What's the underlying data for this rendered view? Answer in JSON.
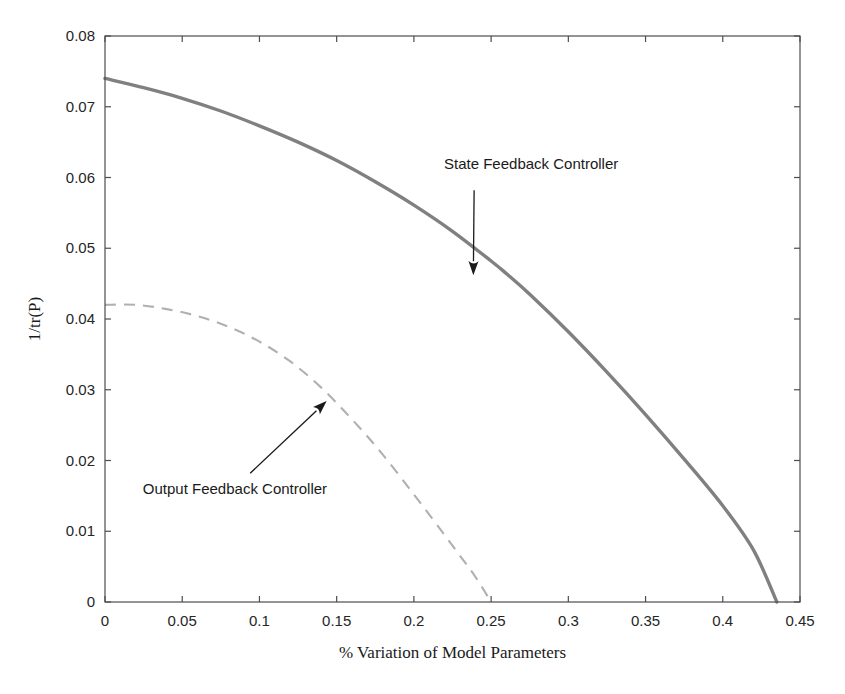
{
  "chart_data": {
    "type": "line",
    "title": "",
    "xlabel": "% Variation of Model Parameters",
    "ylabel": "1/tr(P)",
    "xlim": [
      0,
      0.45
    ],
    "ylim": [
      0,
      0.08
    ],
    "grid": false,
    "legend_position": "none",
    "xticks": [
      "0",
      "0.05",
      "0.1",
      "0.15",
      "0.2",
      "0.25",
      "0.3",
      "0.35",
      "0.4",
      "0.45"
    ],
    "xtick_values": [
      0,
      0.05,
      0.1,
      0.15,
      0.2,
      0.25,
      0.3,
      0.35,
      0.4,
      0.45
    ],
    "yticks": [
      "0",
      "0.01",
      "0.02",
      "0.03",
      "0.04",
      "0.05",
      "0.06",
      "0.07",
      "0.08"
    ],
    "ytick_values": [
      0,
      0.01,
      0.02,
      0.03,
      0.04,
      0.05,
      0.06,
      0.07,
      0.08
    ],
    "series": [
      {
        "name": "State Feedback Controller",
        "style": "solid",
        "color": "#808080",
        "x": [
          0.0,
          0.025,
          0.05,
          0.075,
          0.1,
          0.125,
          0.15,
          0.175,
          0.2,
          0.225,
          0.25,
          0.26,
          0.275,
          0.3,
          0.325,
          0.35,
          0.375,
          0.4,
          0.42,
          0.435
        ],
        "y": [
          0.074,
          0.0727,
          0.0712,
          0.0694,
          0.0673,
          0.065,
          0.0624,
          0.0594,
          0.0561,
          0.0524,
          0.0482,
          0.0464,
          0.0435,
          0.0382,
          0.0325,
          0.0265,
          0.0202,
          0.0136,
          0.0073,
          0.0
        ]
      },
      {
        "name": "Output Feedback Controller",
        "style": "dashed",
        "color": "#b0b0b0",
        "x": [
          0.0,
          0.02,
          0.04,
          0.06,
          0.08,
          0.1,
          0.12,
          0.14,
          0.16,
          0.18,
          0.2,
          0.215,
          0.23,
          0.24,
          0.25
        ],
        "y": [
          0.042,
          0.042,
          0.0414,
          0.0404,
          0.0389,
          0.0368,
          0.034,
          0.0303,
          0.0258,
          0.0208,
          0.0152,
          0.0109,
          0.0065,
          0.0035,
          0.0
        ]
      }
    ],
    "annotations": [
      {
        "text": "State Feedback Controller",
        "text_x": 0.2195,
        "text_y": 0.0612,
        "arrow_from_x": 0.239,
        "arrow_from_y": 0.0582,
        "arrow_to_x": 0.2385,
        "arrow_to_y": 0.0462
      },
      {
        "text": "Output Feedback Controller",
        "text_x": 0.0245,
        "text_y": 0.0153,
        "arrow_from_x": 0.094,
        "arrow_from_y": 0.0182,
        "arrow_to_x": 0.1435,
        "arrow_to_y": 0.0284
      }
    ]
  },
  "figure": {
    "background_color": "#ffffff",
    "axis_color": "#4d4d4d"
  }
}
